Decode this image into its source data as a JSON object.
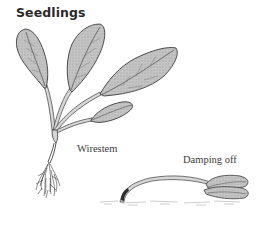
{
  "figure": {
    "title": "Seedlings",
    "panels": [
      {
        "id": "wirestem",
        "label": "Wirestem",
        "description": "Upright seedling with several large leaves, constricted stem at soil line and fibrous roots"
      },
      {
        "id": "damping_off",
        "label": "Damping off",
        "description": "Collapsed seedling lying on soil surface with stem bent over at soil line"
      }
    ]
  },
  "colors": {
    "leaf_fill": "#bdbdbd",
    "leaf_stroke": "#3c3c3c",
    "vein": "#4a4a4a",
    "stem_fill": "#d6d6d6",
    "root": "#2e2e2e",
    "soil": "#9a9a9a",
    "text": "#2a2a2a"
  }
}
